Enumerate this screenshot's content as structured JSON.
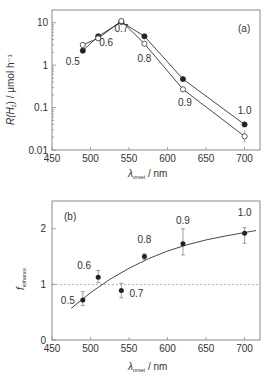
{
  "chart_data": [
    {
      "panel": "(a)",
      "type": "line",
      "title": "",
      "xlabel": "λ onset / nm",
      "ylabel": "R(H2) / μmol h⁻¹",
      "yscale": "log",
      "xlim": [
        450,
        720
      ],
      "ylim": [
        0.01,
        20
      ],
      "xticks": [
        450,
        500,
        550,
        600,
        650,
        700
      ],
      "yticks": [
        0.01,
        0.1,
        1,
        10
      ],
      "ytick_labels": [
        "0.01",
        "0.1",
        "1",
        "10"
      ],
      "x": [
        490,
        510,
        540,
        570,
        620,
        700
      ],
      "point_labels": [
        "0.5",
        "0.6",
        "0.7",
        "0.8",
        "0.9",
        "1.0"
      ],
      "series": [
        {
          "name": "filled circles",
          "marker": "filled-circle",
          "values": [
            2.2,
            4.8,
            10.5,
            4.8,
            0.47,
            0.04
          ]
        },
        {
          "name": "open circles",
          "marker": "open-circle",
          "values": [
            3.0,
            4.3,
            11.0,
            3.2,
            0.27,
            0.021
          ]
        }
      ],
      "grid": false
    },
    {
      "panel": "(b)",
      "type": "scatter",
      "title": "",
      "xlabel": "λ onset / nm",
      "ylabel": "f enhance",
      "xlim": [
        450,
        720
      ],
      "ylim": [
        0,
        2.5
      ],
      "xticks": [
        450,
        500,
        550,
        600,
        650,
        700
      ],
      "yticks": [
        0,
        1,
        2
      ],
      "x": [
        490,
        510,
        540,
        570,
        620,
        700
      ],
      "point_labels": [
        "0.5",
        "0.6",
        "0.7",
        "0.8",
        "0.9",
        "1.0"
      ],
      "series": [
        {
          "name": "f_enhance",
          "values": [
            0.72,
            1.13,
            0.89,
            1.5,
            1.73,
            1.92
          ],
          "err_low": [
            0.1,
            0.1,
            0.13,
            0.05,
            0.2,
            0.18
          ],
          "err_high": [
            0.15,
            0.12,
            0.13,
            0.05,
            0.27,
            0.1
          ]
        }
      ],
      "fit_curve": {
        "x": [
          475,
          500,
          525,
          550,
          575,
          600,
          625,
          650,
          675,
          715
        ],
        "y": [
          0.57,
          0.85,
          1.09,
          1.29,
          1.46,
          1.6,
          1.71,
          1.8,
          1.87,
          1.97
        ]
      },
      "reference_line": {
        "y": 1,
        "style": "dashed"
      },
      "grid": false
    }
  ],
  "labels": {
    "panel_a": "(a)",
    "panel_b": "(b)",
    "xlabel_main": "λ",
    "xlabel_sub": "onset",
    "xlabel_unit": " / nm",
    "ylabel_a_main": "R(H",
    "ylabel_a_sub": "2",
    "ylabel_a_rest": ") / μmol h⁻¹",
    "ylabel_b_main": "f",
    "ylabel_b_sub": "enhance"
  }
}
